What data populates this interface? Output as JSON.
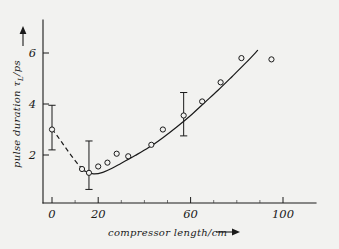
{
  "figure": {
    "background_color": "#f2f2f0",
    "line_color": "#1a1a1a"
  },
  "chart_data": {
    "type": "scatter",
    "title": "",
    "subtitle": "",
    "xlabel": "compressor length/cm",
    "ylabel": "pulse duration τₗ/ps",
    "ylabel_parts": {
      "text": "pulse duration ",
      "symbol": "τ",
      "subscript": "L",
      "units": "/ps"
    },
    "xlim": [
      -6,
      108
    ],
    "ylim": [
      0.0,
      7.0
    ],
    "xticks": [
      0,
      20,
      60,
      100
    ],
    "xticklabels": [
      "0",
      "20",
      "60",
      "100"
    ],
    "xminorticks": [
      10,
      30,
      40,
      50,
      70,
      80,
      90
    ],
    "yticks": [
      2,
      4,
      6
    ],
    "yticklabels": [
      "2",
      "4",
      "6"
    ],
    "grid": false,
    "legend": null,
    "marker": "open-circle",
    "x": [
      0,
      13,
      16,
      20,
      24,
      28,
      33,
      43,
      48,
      57,
      65,
      73,
      82,
      95
    ],
    "y": [
      3.0,
      1.45,
      1.3,
      1.55,
      1.7,
      2.05,
      1.95,
      2.4,
      3.0,
      3.55,
      4.1,
      4.85,
      5.8,
      5.75
    ],
    "values": [
      3.0,
      1.45,
      1.3,
      1.55,
      1.7,
      2.05,
      1.95,
      2.4,
      3.0,
      3.55,
      4.1,
      4.85,
      5.8,
      5.75
    ],
    "errorbars": [
      {
        "x": 0,
        "y": 3.0,
        "ymin": 2.2,
        "ymax": 3.95
      },
      {
        "x": 16,
        "y": 1.3,
        "ymin": 0.65,
        "ymax": 2.55
      },
      {
        "x": 57,
        "y": 3.55,
        "ymin": 2.75,
        "ymax": 4.45
      }
    ],
    "fit_curve_solid": [
      [
        14.0,
        1.38
      ],
      [
        18.0,
        1.26
      ],
      [
        22.0,
        1.32
      ],
      [
        26.0,
        1.48
      ],
      [
        30.0,
        1.68
      ],
      [
        36.0,
        1.98
      ],
      [
        42.0,
        2.3
      ],
      [
        48.0,
        2.68
      ],
      [
        54.0,
        3.1
      ],
      [
        60.0,
        3.55
      ],
      [
        66.0,
        4.05
      ],
      [
        72.0,
        4.55
      ],
      [
        78.0,
        5.08
      ],
      [
        84.0,
        5.62
      ],
      [
        89.0,
        6.1
      ]
    ],
    "fit_curve_dashed": [
      [
        0.0,
        3.02
      ],
      [
        2.5,
        2.72
      ],
      [
        5.0,
        2.4
      ],
      [
        7.5,
        2.08
      ],
      [
        10.0,
        1.78
      ],
      [
        12.0,
        1.56
      ],
      [
        14.0,
        1.38
      ]
    ],
    "annotations": [
      {
        "name": "y-axis-arrow",
        "description": "upward arrow above y-axis label"
      },
      {
        "name": "x-axis-arrow",
        "description": "rightward arrow after x-axis label"
      }
    ]
  }
}
